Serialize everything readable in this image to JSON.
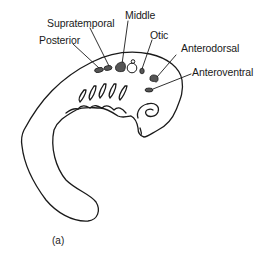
{
  "figure": {
    "caption": "(a)",
    "colors": {
      "outline": "#1a1a1a",
      "placode_fill": "#555555",
      "background": "#ffffff"
    },
    "labels": {
      "supratemporal": "Supratemporal",
      "middle": "Middle",
      "otic": "Otic",
      "posterior": "Posterior",
      "anterodorsal": "Anterodorsal",
      "anteroventral": "Anteroventral"
    }
  }
}
